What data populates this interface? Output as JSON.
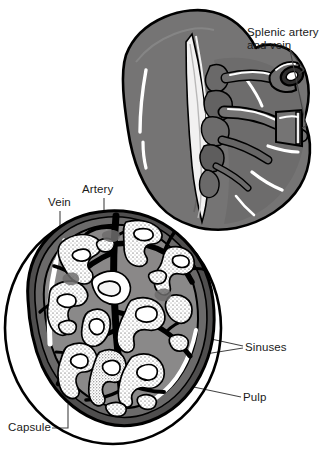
{
  "figure": {
    "background_color": "#ffffff",
    "width": 330,
    "height": 449
  },
  "palette": {
    "outline": "#000000",
    "spleen_body": "#75 7474",
    "spleen_gray": "#757474",
    "spleen_gray_dark": "#5c5b5b",
    "pulp_gray": "#8a8989",
    "capsule_dark": "#4f4e4e",
    "capsule_mid": "#6b6a6a",
    "sinus_white": "#ffffff",
    "highlight": "#ffffff",
    "leader_line": "#555555",
    "text": "#1a1a1a"
  },
  "labels": {
    "splenic_artery_and_vein": "Splenic artery\nand vein",
    "artery": "Artery",
    "vein": "Vein",
    "sinuses": "Sinuses",
    "pulp": "Pulp",
    "capsule": "Capsule"
  },
  "structures": [
    {
      "name": "spleen-body",
      "label": "Spleen (external surface)"
    },
    {
      "name": "splenic-hilum",
      "label": "Hilum with branching vessels"
    },
    {
      "name": "cut-vessel-end",
      "label": "Cut end of splenic artery"
    },
    {
      "name": "cut-vessel-band",
      "label": "Cut end of splenic vein"
    },
    {
      "name": "magnifier-circle",
      "label": "Magnified section circle"
    },
    {
      "name": "section-wedge",
      "label": "Cut section of spleen"
    },
    {
      "name": "trabeculae",
      "label": "Trabeculae and vessels"
    },
    {
      "name": "sinus-network",
      "label": "Venous sinuses"
    },
    {
      "name": "pulp-region",
      "label": "Splenic pulp"
    },
    {
      "name": "capsule-band",
      "label": "Fibrous capsule"
    }
  ]
}
